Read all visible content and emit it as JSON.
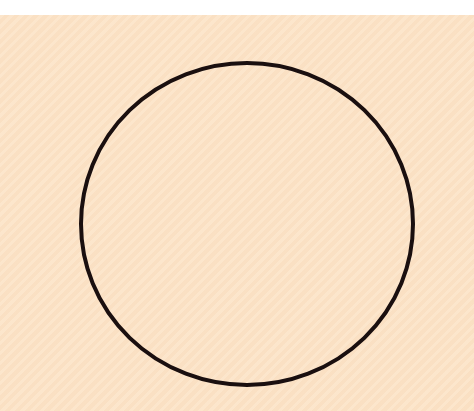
{
  "figure": {
    "background_color": "#fce3c6",
    "top_strip_color": "#ffffff",
    "shape": {
      "type": "circle",
      "center_x": 247,
      "center_y": 224,
      "radius_x": 166,
      "radius_y": 161,
      "stroke_color": "#1a0f0f",
      "stroke_width": 4,
      "fill": "none"
    }
  }
}
